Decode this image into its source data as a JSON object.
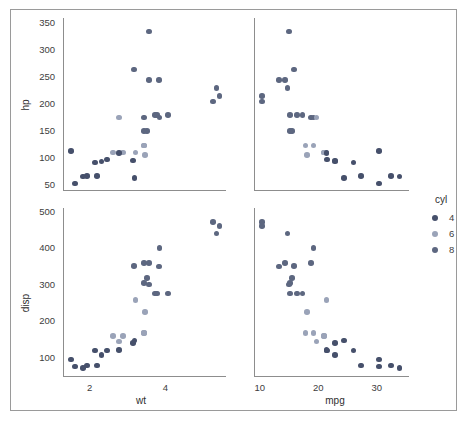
{
  "chart_data": {
    "type": "scatter",
    "title": "",
    "layout": "2x2 facet grid (scatterplot matrix)",
    "grid": false,
    "legend": {
      "title": "cyl",
      "position": "right",
      "entries": [
        {
          "label": "4",
          "color": "#46506b"
        },
        {
          "label": "6",
          "color": "#9aa3b8"
        },
        {
          "label": "8",
          "color": "#5d6780"
        }
      ]
    },
    "colors": {
      "cyl_4": "#46506b",
      "cyl_6": "#9aa3b8",
      "cyl_8": "#5d6780",
      "axis": "#8d8d8d",
      "frame": "#9a9a9a",
      "text": "#3d3d3d",
      "background": "#ffffff"
    },
    "panels": [
      {
        "id": "hp-vs-wt",
        "xlabel": "",
        "ylabel": "hp",
        "xvar": "wt",
        "yvar": "hp",
        "xlim": [
          1.3,
          5.6
        ],
        "ylim": [
          40,
          360
        ],
        "xticks": [],
        "yticks": [
          50,
          100,
          150,
          200,
          250,
          300,
          350
        ]
      },
      {
        "id": "hp-vs-mpg",
        "xlabel": "",
        "ylabel": "",
        "xvar": "mpg",
        "yvar": "hp",
        "xlim": [
          9,
          35.5
        ],
        "ylim": [
          40,
          360
        ],
        "xticks": [],
        "yticks": []
      },
      {
        "id": "disp-vs-wt",
        "xlabel": "wt",
        "ylabel": "disp",
        "xvar": "wt",
        "yvar": "disp",
        "xlim": [
          1.3,
          5.6
        ],
        "ylim": [
          50,
          510
        ],
        "xticks": [
          2,
          4
        ],
        "yticks": [
          100,
          200,
          300,
          400,
          500
        ]
      },
      {
        "id": "disp-vs-mpg",
        "xlabel": "mpg",
        "ylabel": "",
        "xvar": "mpg",
        "yvar": "disp",
        "xlim": [
          9,
          35.5
        ],
        "ylim": [
          50,
          510
        ],
        "xticks": [
          10,
          20,
          30
        ],
        "yticks": []
      }
    ],
    "points": [
      {
        "wt": 2.62,
        "mpg": 21.0,
        "hp": 110,
        "disp": 160.0,
        "cyl": 6
      },
      {
        "wt": 2.875,
        "mpg": 21.0,
        "hp": 110,
        "disp": 160.0,
        "cyl": 6
      },
      {
        "wt": 2.32,
        "mpg": 22.8,
        "hp": 93,
        "disp": 108.0,
        "cyl": 4
      },
      {
        "wt": 3.215,
        "mpg": 21.4,
        "hp": 110,
        "disp": 258.0,
        "cyl": 6
      },
      {
        "wt": 3.44,
        "mpg": 18.7,
        "hp": 175,
        "disp": 360.0,
        "cyl": 8
      },
      {
        "wt": 3.46,
        "mpg": 18.1,
        "hp": 105,
        "disp": 225.0,
        "cyl": 6
      },
      {
        "wt": 3.57,
        "mpg": 14.3,
        "hp": 245,
        "disp": 360.0,
        "cyl": 8
      },
      {
        "wt": 3.19,
        "mpg": 24.4,
        "hp": 62,
        "disp": 146.7,
        "cyl": 4
      },
      {
        "wt": 3.15,
        "mpg": 22.8,
        "hp": 95,
        "disp": 140.8,
        "cyl": 4
      },
      {
        "wt": 3.44,
        "mpg": 19.2,
        "hp": 123,
        "disp": 167.6,
        "cyl": 6
      },
      {
        "wt": 3.44,
        "mpg": 17.8,
        "hp": 123,
        "disp": 167.6,
        "cyl": 6
      },
      {
        "wt": 4.07,
        "mpg": 16.4,
        "hp": 180,
        "disp": 275.8,
        "cyl": 8
      },
      {
        "wt": 3.73,
        "mpg": 17.3,
        "hp": 180,
        "disp": 275.8,
        "cyl": 8
      },
      {
        "wt": 3.78,
        "mpg": 15.2,
        "hp": 180,
        "disp": 275.8,
        "cyl": 8
      },
      {
        "wt": 5.25,
        "mpg": 10.4,
        "hp": 205,
        "disp": 472.0,
        "cyl": 8
      },
      {
        "wt": 5.424,
        "mpg": 10.4,
        "hp": 215,
        "disp": 460.0,
        "cyl": 8
      },
      {
        "wt": 5.345,
        "mpg": 14.7,
        "hp": 230,
        "disp": 440.0,
        "cyl": 8
      },
      {
        "wt": 2.2,
        "mpg": 32.4,
        "hp": 66,
        "disp": 78.7,
        "cyl": 4
      },
      {
        "wt": 1.615,
        "mpg": 30.4,
        "hp": 52,
        "disp": 75.7,
        "cyl": 4
      },
      {
        "wt": 1.835,
        "mpg": 33.9,
        "hp": 65,
        "disp": 71.1,
        "cyl": 4
      },
      {
        "wt": 2.465,
        "mpg": 21.5,
        "hp": 97,
        "disp": 120.1,
        "cyl": 4
      },
      {
        "wt": 3.52,
        "mpg": 15.5,
        "hp": 150,
        "disp": 318.0,
        "cyl": 8
      },
      {
        "wt": 3.435,
        "mpg": 15.2,
        "hp": 150,
        "disp": 304.0,
        "cyl": 8
      },
      {
        "wt": 3.84,
        "mpg": 13.3,
        "hp": 245,
        "disp": 350.0,
        "cyl": 8
      },
      {
        "wt": 3.845,
        "mpg": 19.2,
        "hp": 175,
        "disp": 400.0,
        "cyl": 8
      },
      {
        "wt": 1.935,
        "mpg": 27.3,
        "hp": 66,
        "disp": 79.0,
        "cyl": 4
      },
      {
        "wt": 2.14,
        "mpg": 26.0,
        "hp": 91,
        "disp": 120.3,
        "cyl": 4
      },
      {
        "wt": 1.513,
        "mpg": 30.4,
        "hp": 113,
        "disp": 95.1,
        "cyl": 4
      },
      {
        "wt": 3.17,
        "mpg": 15.8,
        "hp": 264,
        "disp": 351.0,
        "cyl": 8
      },
      {
        "wt": 2.77,
        "mpg": 19.7,
        "hp": 175,
        "disp": 145.0,
        "cyl": 6
      },
      {
        "wt": 3.57,
        "mpg": 15.0,
        "hp": 335,
        "disp": 301.0,
        "cyl": 8
      },
      {
        "wt": 2.78,
        "mpg": 21.4,
        "hp": 109,
        "disp": 121.0,
        "cyl": 4
      }
    ]
  }
}
